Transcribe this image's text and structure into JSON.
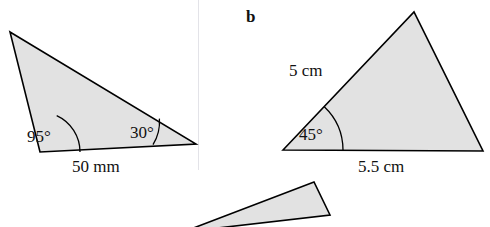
{
  "figure": {
    "title_b": "b",
    "colors": {
      "fill": "#e2e2e2",
      "stroke": "#000000",
      "arc": "#000000",
      "divider": "#e3e3e8",
      "text": "#111111"
    },
    "triangles": [
      {
        "name": "triangle-a",
        "points": "10,32 196,144 40,152",
        "angles": [
          {
            "name": "angle-95",
            "label": "95°",
            "x": 27,
            "y": 128
          },
          {
            "name": "angle-30",
            "label": "30°",
            "x": 130,
            "y": 124
          }
        ],
        "sides": [
          {
            "name": "side-50mm",
            "label": "50 mm",
            "x": 72,
            "y": 158
          }
        ]
      },
      {
        "name": "triangle-b",
        "points": "283,150 414,12 483,151",
        "angles": [
          {
            "name": "angle-45",
            "label": "45°",
            "x": 299,
            "y": 126
          }
        ],
        "sides": [
          {
            "name": "side-5cm",
            "label": "5 cm",
            "x": 289,
            "y": 62
          },
          {
            "name": "side-5-5cm",
            "label": "5.5 cm",
            "x": 358,
            "y": 158
          }
        ]
      },
      {
        "name": "triangle-c",
        "points": "183,227 314,182 326,209",
        "angles": [],
        "sides": []
      }
    ],
    "divider_x": 198
  }
}
